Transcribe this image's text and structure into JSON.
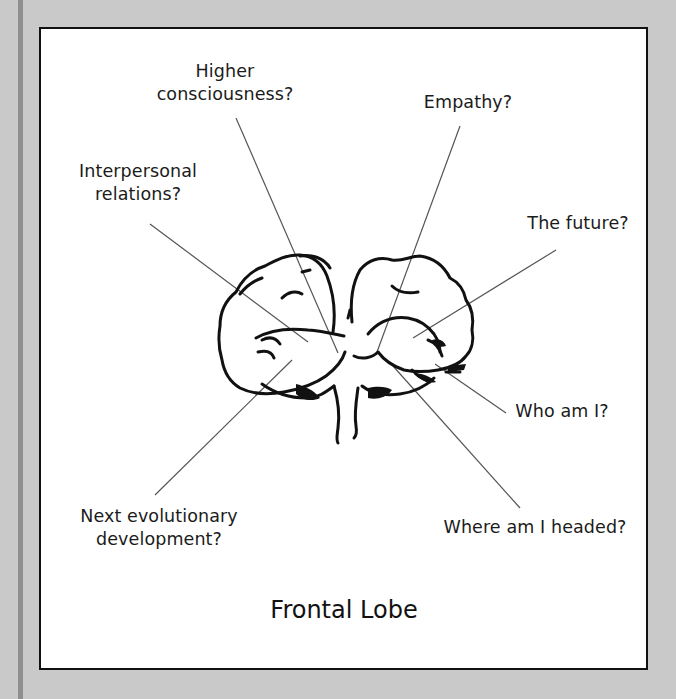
{
  "diagram": {
    "title": "Frontal Lobe",
    "colors": {
      "background": "#c9c9c9",
      "side_stripe": "#8f8f8f",
      "panel": "#ffffff",
      "panel_border": "#111111",
      "leader_line": "#555555",
      "ink": "#111111"
    },
    "labels": [
      {
        "id": "higher-consciousness",
        "lines": [
          "Higher",
          "consciousness?"
        ]
      },
      {
        "id": "empathy",
        "lines": [
          "Empathy?"
        ]
      },
      {
        "id": "interpersonal-relations",
        "lines": [
          "Interpersonal",
          "relations?"
        ]
      },
      {
        "id": "the-future",
        "lines": [
          "The future?"
        ]
      },
      {
        "id": "who-am-i",
        "lines": [
          "Who am I?"
        ]
      },
      {
        "id": "next-evolutionary-development",
        "lines": [
          "Next evolutionary",
          "development?"
        ]
      },
      {
        "id": "where-am-i-headed",
        "lines": [
          "Where am I headed?"
        ]
      }
    ]
  }
}
